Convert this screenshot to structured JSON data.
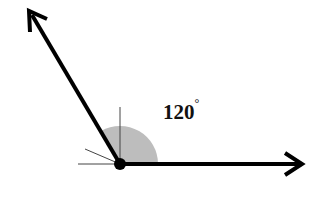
{
  "diagram": {
    "angle_label": "120",
    "degree_symbol": "°",
    "angle_degrees": 120,
    "colors": {
      "rays": "#000000",
      "arc_fill": "#bdbdbd",
      "guides": "#444444"
    }
  }
}
